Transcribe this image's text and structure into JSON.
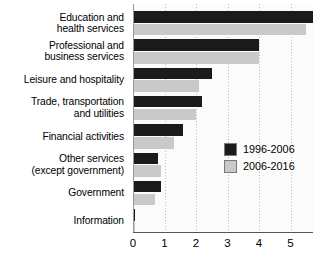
{
  "chart_data": {
    "type": "bar",
    "orientation": "horizontal",
    "title": "",
    "subtitle": "",
    "xlabel": "",
    "ylabel": "",
    "xlim": [
      0,
      5.7
    ],
    "ylim": null,
    "grid": "vertical-dotted",
    "legend_position": "middle-right",
    "xticks": [
      "0",
      "1",
      "2",
      "3",
      "4",
      "5"
    ],
    "xtick_values": [
      0,
      1,
      2,
      3,
      4,
      5
    ],
    "categories": [
      "Education and\nhealth services",
      "Professional and\nbusiness services",
      "Leisure and hospitality",
      "Trade, transportation\nand utilities",
      "Financial activities",
      "Other services\n(except government)",
      "Government",
      "Information"
    ],
    "category_lines": [
      [
        "Education and",
        "health services"
      ],
      [
        "Professional and",
        "business services"
      ],
      [
        "Leisure and hospitality"
      ],
      [
        "Trade, transportation",
        "and utilities"
      ],
      [
        "Financial activities"
      ],
      [
        "Other services",
        "(except government)"
      ],
      [
        "Government"
      ],
      [
        "Information"
      ]
    ],
    "series": [
      {
        "name": "1996-2006",
        "color": "#1b1b1b",
        "values": [
          5.7,
          4.0,
          2.5,
          2.2,
          1.6,
          0.8,
          0.9,
          0.05
        ]
      },
      {
        "name": "2006-2016",
        "color": "#c9c9c9",
        "values": [
          5.5,
          4.0,
          2.1,
          2.0,
          1.3,
          0.9,
          0.7,
          0.05
        ]
      }
    ]
  },
  "legend": {
    "entries": [
      {
        "label": "1996-2006",
        "swatch": "dark-swatch"
      },
      {
        "label": "2006-2016",
        "swatch": "light-swatch"
      }
    ]
  }
}
